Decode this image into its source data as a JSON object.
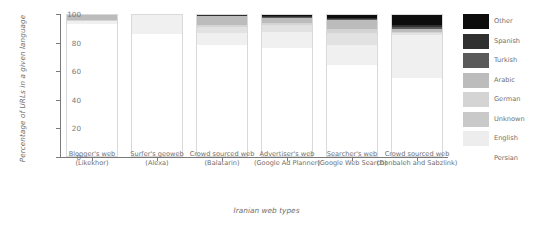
{
  "chart_data": {
    "type": "bar",
    "subtype": "stacked-bar-100",
    "title": "",
    "xlabel": "Iranian web types",
    "ylabel": "Percentage of URLs in a given language",
    "ylim": [
      0,
      100
    ],
    "yticks": [
      0,
      20,
      40,
      60,
      80,
      100
    ],
    "grid": false,
    "legend_position": "right",
    "categories": [
      "Blogger's web (Likekhor)",
      "Surfer's geoweb (Alexa)",
      "Crowd sourced web (Balatarin)",
      "Advertiser's web (Google Ad Planner)",
      "Searcher's web (Google Web Search)",
      "Crowd sourced web (Donbaleh and Sabzlink)"
    ],
    "categories_lines": [
      [
        "Blogger's web",
        "(Likekhor)"
      ],
      [
        "Surfer's geoweb",
        "(Alexa)"
      ],
      [
        "Crowd sourced web",
        "(Balatarin)"
      ],
      [
        "Advertiser's web",
        "(Google Ad Planner)"
      ],
      [
        "Searcher's web",
        "(Google Web Search)"
      ],
      [
        "Crowd sourced web",
        "(Donbaleh and Sabzlink)"
      ]
    ],
    "series": [
      {
        "name": "Persian",
        "color": "#ffffff",
        "values": [
          93.0,
          86.0,
          78.0,
          76.0,
          64.5,
          55.0
        ]
      },
      {
        "name": "English",
        "color": "#f0f0f0",
        "values": [
          2.0,
          14.0,
          9.0,
          11.5,
          14.0,
          30.0
        ]
      },
      {
        "name": "Unknown",
        "color": "#e2e2e2",
        "values": [
          0.5,
          0.0,
          4.0,
          5.0,
          8.5,
          1.5
        ]
      },
      {
        "name": "German",
        "color": "#d4d4d4",
        "values": [
          0.5,
          0.0,
          1.5,
          1.0,
          2.5,
          1.0
        ]
      },
      {
        "name": "Arabic",
        "color": "#bcbcbc",
        "values": [
          3.5,
          0.0,
          6.0,
          4.0,
          6.0,
          2.0
        ]
      },
      {
        "name": "Turkish",
        "color": "#5a5a5a",
        "values": [
          0.3,
          0.0,
          0.5,
          0.5,
          1.0,
          1.5
        ]
      },
      {
        "name": "Spanish",
        "color": "#303030",
        "values": [
          0.2,
          0.0,
          0.3,
          0.4,
          0.8,
          1.5
        ]
      },
      {
        "name": "Other",
        "color": "#0d0d0d",
        "values": [
          0.0,
          0.0,
          0.7,
          1.6,
          2.7,
          7.5
        ]
      }
    ],
    "legend_entries": [
      {
        "label": "Other",
        "color": "#0d0d0d"
      },
      {
        "label": "Spanish",
        "color": "#303030"
      },
      {
        "label": "Turkish",
        "color": "#5a5a5a"
      },
      {
        "label": "Arabic",
        "color": "#bcbcbc"
      },
      {
        "label": "German",
        "color": "#d4d4d4"
      },
      {
        "label": "Unknown",
        "color": "#c9c9c9"
      },
      {
        "label": "English",
        "color": "#ededed"
      },
      {
        "label": "Persian",
        "color": "#ffffff"
      }
    ]
  }
}
